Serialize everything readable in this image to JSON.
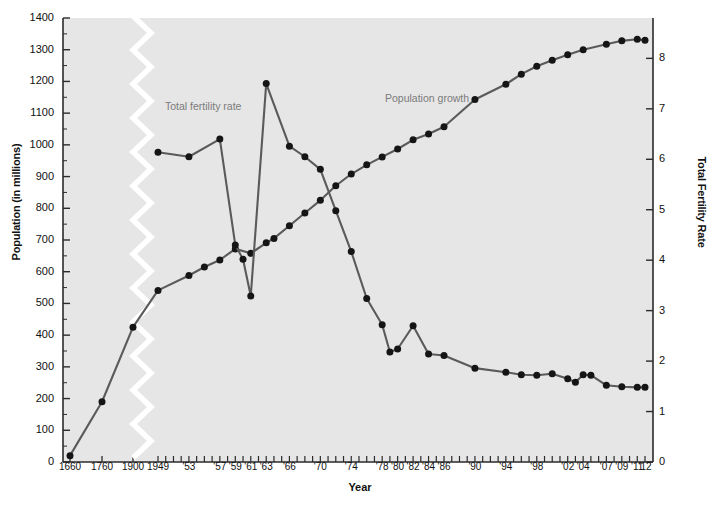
{
  "chart_data": {
    "type": "line",
    "title": "",
    "xlabel": "Year",
    "ylabel": "Population (in millions)",
    "ylabel_right": "Total Fertility Rate",
    "ylim": [
      0,
      1400
    ],
    "ylim_right": [
      0,
      8.8
    ],
    "yticks": [
      0,
      100,
      200,
      300,
      400,
      500,
      600,
      700,
      800,
      900,
      1000,
      1100,
      1200,
      1300,
      1400
    ],
    "yticks_right": [
      0,
      1,
      2,
      3,
      4,
      5,
      6,
      7,
      8
    ],
    "grid": false,
    "axis_break": true,
    "axis_break_note": "white zigzag break between 1900 and 1949",
    "legend_position": "inline-annotations",
    "xticks_labeled": [
      "1660",
      "1760",
      "1900",
      "1949",
      "'53",
      "'57",
      "'59",
      "'61",
      "'63",
      "'66",
      "'70",
      "'74",
      "'78",
      "'80",
      "'82",
      "'84",
      "'86",
      "'90",
      "'94",
      "'98",
      "'02",
      "'04",
      "'07",
      "'09",
      "'11",
      "'12"
    ],
    "annotations": [
      {
        "text": "Total fertility rate",
        "x": 165,
        "y": 100
      },
      {
        "text": "Population growth",
        "x": 385,
        "y": 92
      }
    ],
    "series": [
      {
        "name": "Population growth",
        "axis": "left",
        "unit": "millions",
        "color": "#5a5a5a",
        "points": [
          {
            "year": "1660",
            "value": 20
          },
          {
            "year": "1760",
            "value": 190
          },
          {
            "year": "1900",
            "value": 425
          },
          {
            "year": "1949",
            "value": 541
          },
          {
            "year": "1953",
            "value": 588
          },
          {
            "year": "1955",
            "value": 615
          },
          {
            "year": "1957",
            "value": 637
          },
          {
            "year": "1959",
            "value": 672
          },
          {
            "year": "1961",
            "value": 658
          },
          {
            "year": "1963",
            "value": 691
          },
          {
            "year": "1964",
            "value": 705
          },
          {
            "year": "1966",
            "value": 745
          },
          {
            "year": "1968",
            "value": 785
          },
          {
            "year": "1970",
            "value": 825
          },
          {
            "year": "1972",
            "value": 871
          },
          {
            "year": "1974",
            "value": 908
          },
          {
            "year": "1976",
            "value": 937
          },
          {
            "year": "1978",
            "value": 962
          },
          {
            "year": "1980",
            "value": 987
          },
          {
            "year": "1982",
            "value": 1016
          },
          {
            "year": "1984",
            "value": 1034
          },
          {
            "year": "1986",
            "value": 1057
          },
          {
            "year": "1990",
            "value": 1143
          },
          {
            "year": "1994",
            "value": 1191
          },
          {
            "year": "1996",
            "value": 1223
          },
          {
            "year": "1998",
            "value": 1248
          },
          {
            "year": "2000",
            "value": 1267
          },
          {
            "year": "2002",
            "value": 1284
          },
          {
            "year": "2004",
            "value": 1300
          },
          {
            "year": "2007",
            "value": 1317
          },
          {
            "year": "2009",
            "value": 1328
          },
          {
            "year": "2011",
            "value": 1333
          },
          {
            "year": "2012",
            "value": 1330
          }
        ]
      },
      {
        "name": "Total fertility rate",
        "axis": "right",
        "unit": "births per woman",
        "color": "#5a5a5a",
        "points": [
          {
            "year": "1949",
            "value": 6.14
          },
          {
            "year": "1953",
            "value": 6.05
          },
          {
            "year": "1957",
            "value": 6.4
          },
          {
            "year": "1959",
            "value": 4.3
          },
          {
            "year": "1960",
            "value": 4.02
          },
          {
            "year": "1961",
            "value": 3.29
          },
          {
            "year": "1963",
            "value": 7.5
          },
          {
            "year": "1966",
            "value": 6.26
          },
          {
            "year": "1968",
            "value": 6.05
          },
          {
            "year": "1970",
            "value": 5.8
          },
          {
            "year": "1972",
            "value": 4.98
          },
          {
            "year": "1974",
            "value": 4.17
          },
          {
            "year": "1976",
            "value": 3.24
          },
          {
            "year": "1978",
            "value": 2.72
          },
          {
            "year": "1979",
            "value": 2.18
          },
          {
            "year": "1980",
            "value": 2.24
          },
          {
            "year": "1982",
            "value": 2.7
          },
          {
            "year": "1984",
            "value": 2.14
          },
          {
            "year": "1986",
            "value": 2.11
          },
          {
            "year": "1990",
            "value": 1.86
          },
          {
            "year": "1994",
            "value": 1.78
          },
          {
            "year": "1996",
            "value": 1.73
          },
          {
            "year": "1998",
            "value": 1.72
          },
          {
            "year": "2000",
            "value": 1.75
          },
          {
            "year": "2002",
            "value": 1.65
          },
          {
            "year": "2003",
            "value": 1.58
          },
          {
            "year": "2004",
            "value": 1.73
          },
          {
            "year": "2005",
            "value": 1.72
          },
          {
            "year": "2007",
            "value": 1.52
          },
          {
            "year": "2009",
            "value": 1.49
          },
          {
            "year": "2011",
            "value": 1.48
          },
          {
            "year": "2012",
            "value": 1.48
          }
        ]
      }
    ]
  }
}
